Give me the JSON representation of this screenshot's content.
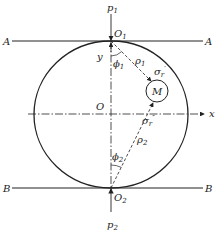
{
  "diagram": {
    "labels": {
      "line_a_left": "A",
      "line_a_right": "A",
      "line_b_left": "B",
      "line_b_right": "B",
      "origin": "O",
      "x_axis": "x",
      "y_axis": "y",
      "point_m": "M",
      "o1": {
        "base": "O",
        "sub": "1"
      },
      "o2": {
        "base": "O",
        "sub": "2"
      },
      "p1": {
        "base": "p",
        "sub": "1"
      },
      "p2": {
        "base": "p",
        "sub": "2"
      },
      "rho1": {
        "base": "ρ",
        "sub": "1"
      },
      "rho2": {
        "base": "ρ",
        "sub": "2"
      },
      "phi1": {
        "base": "ϕ",
        "sub": "1"
      },
      "phi2": {
        "base": "ϕ",
        "sub": "2"
      },
      "sigma_r1": {
        "base": "σ",
        "sub": "r",
        "sup": "′"
      },
      "sigma_r2": {
        "base": "σ",
        "sub": "r",
        "sup": "″"
      }
    },
    "colors": {
      "stroke": "#222222",
      "background": "#ffffff"
    }
  }
}
